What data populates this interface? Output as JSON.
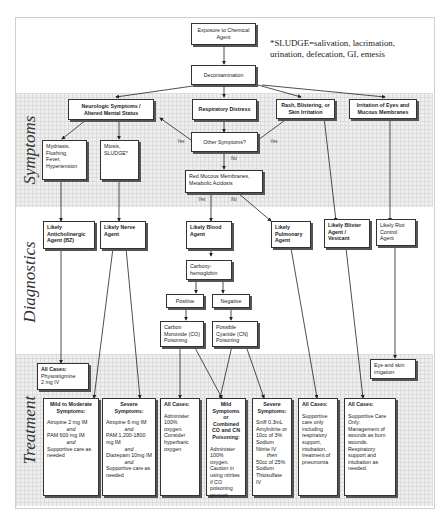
{
  "note": {
    "text_line1": "*SLUDGE=salivation, lacrimation,",
    "text_line2": "urination, defecation, GI, emesis"
  },
  "sections": {
    "symptoms": "Symptoms",
    "diagnostics": "Diagnostics",
    "treatment": "Treatment"
  },
  "nodes": {
    "exposure": "Exposure to Chemical Agent",
    "decon": "Decontamination",
    "neuro": "Neurologic Symptoms / Altered Mental Status",
    "resp": "Respiratory Distress",
    "rash": "Rash, Blistering, or Skin Irritation",
    "eyes": "Irritation of Eyes and Mucous Membranes",
    "mydriasis": "Mydriasis, Flushing, Fever, Hypertension",
    "miosis": "Miosis, SLUDGE*",
    "other": "Other Symptoms?",
    "red_mucous": "Red Mucous Membranes, Metabolic Acidosis",
    "bz": "Likely Anticholinergic Agent (BZ)",
    "nerve": "Likely Nerve Agent",
    "blood": "Likely Blood Agent",
    "pulmonary": "Likely Pulmonary Agent",
    "blister": "Likely Blister Agent / Vesicant",
    "riot": "Likely Riot Control Agent",
    "carboxy": "Carboxy-hemoglobin",
    "positive": "Positive",
    "negative": "Negative",
    "co": "Carbon Monoxide (CO) Poisoning",
    "cn": "Possible Cyanide (CN) Poisoning",
    "eye_irrigation": "Eye and skin irrigation"
  },
  "edge_labels": {
    "yes_left": "Yes",
    "yes_right": "Yes",
    "no_other": "No",
    "yes_red": "Yes",
    "no_red": "No"
  },
  "treatments": {
    "bz_all": {
      "title": "All Cases:",
      "l1": "Physostigmine",
      "l2": "2 mg IV"
    },
    "nerve_mild": {
      "title": "Mild to Moderate Symptoms:",
      "l1": "Atropine 2 mg IM",
      "and1": "and",
      "l2": "PAM 600 mg IM",
      "and2": "and",
      "l3": "Supportive care as needed"
    },
    "nerve_severe": {
      "title": "Severe Symptoms:",
      "l1": "Atropine 6 mg IM",
      "and1": "and",
      "l2": "PAM 1,200-1800 mg IM",
      "and2": "and",
      "l3": "Diazepam 10mg IM",
      "and3": "and",
      "l4": "Supportive care as needed"
    },
    "co_all": {
      "title": "All Cases:",
      "l1": "Administer 100% oxygen. Consider hyperbaric oxygen"
    },
    "cn_mild": {
      "title": "Mild Symptoms or Combined CO and CN Poisoning:",
      "l1": "Administer 100% oxygen. Caution in using nitrites if CO poisoning present"
    },
    "cn_severe": {
      "title": "Severe Symptoms:",
      "l1": "Sniff 0.3mL Amylnitrite or 10cc of 3% Sodium Nitrite IV",
      "then": "then",
      "l2": "50cc of 25% Sodium Thiosulfate IV"
    },
    "pulm_all": {
      "title": "All Cases:",
      "l1": "Supportive care only including respiratory support, intubation, treatment of pneumonia"
    },
    "blister_all": {
      "title": "All Cases:",
      "l1": "Supportive Care Only: Management of wounds as burn wounds. Respiratory support and intubation as needed."
    }
  }
}
